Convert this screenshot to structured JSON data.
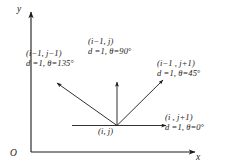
{
  "figure": {
    "background_color": "#ffffff",
    "line_color": "#1a1a1a",
    "width": 232,
    "height": 168
  },
  "axes": {
    "y_label": "y",
    "x_label": "x",
    "origin_label": "O"
  },
  "center": {
    "coord_label": "(i, j)"
  },
  "neighbors": [
    {
      "id": "upper-left",
      "coord_label": "(i−1, j−1)",
      "distance_label": "d =1,",
      "theta_label": "θ=135",
      "degree_symbol": "°",
      "d": 1,
      "theta_deg": 135
    },
    {
      "id": "up",
      "coord_label": "(i−1, j)",
      "distance_label": "d =1,",
      "theta_label": "θ=90",
      "degree_symbol": "°",
      "d": 1,
      "theta_deg": 90
    },
    {
      "id": "upper-right",
      "coord_label": "(i−1 , j+1)",
      "distance_label": "d =1,",
      "theta_label": "θ=45",
      "degree_symbol": "°",
      "d": 1,
      "theta_deg": 45
    },
    {
      "id": "right",
      "coord_label": "(i , j+1)",
      "distance_label": "d =1,",
      "theta_label": "θ=0",
      "degree_symbol": "°",
      "d": 1,
      "theta_deg": 0
    }
  ]
}
